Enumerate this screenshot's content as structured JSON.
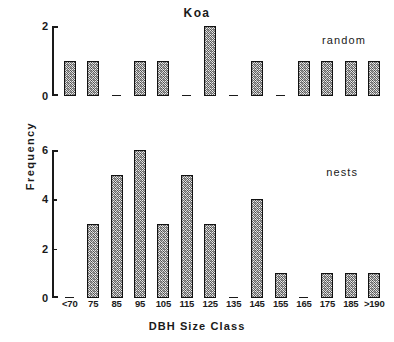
{
  "figure": {
    "title": "Koa",
    "xaxis_title": "DBH Size Class",
    "yaxis_title": "Frequency"
  },
  "panels": {
    "random": {
      "note": "random",
      "yticks": [
        "2",
        "0"
      ]
    },
    "nests": {
      "note": "nests",
      "yticks": [
        "6",
        "4",
        "2",
        "0"
      ]
    }
  },
  "chart_data": [
    {
      "type": "bar",
      "title": "Koa",
      "series_label": "random",
      "panel": "top",
      "categories": [
        "<70",
        "75",
        "85",
        "95",
        "105",
        "115",
        "125",
        "135",
        "145",
        "155",
        "165",
        "175",
        "185",
        ">190"
      ],
      "values": [
        1,
        1,
        0,
        1,
        1,
        0,
        2,
        0,
        1,
        0,
        1,
        1,
        1,
        1
      ],
      "xlabel": "DBH Size Class",
      "ylabel": "Frequency",
      "ylim": [
        0,
        2
      ],
      "ytick_values": [
        0,
        2
      ],
      "grid": false,
      "legend": "none"
    },
    {
      "type": "bar",
      "title": "Koa",
      "series_label": "nests",
      "panel": "bottom",
      "categories": [
        "<70",
        "75",
        "85",
        "95",
        "105",
        "115",
        "125",
        "135",
        "145",
        "155",
        "165",
        "175",
        "185",
        ">190"
      ],
      "values": [
        0,
        3,
        5,
        6,
        3,
        5,
        3,
        0,
        4,
        1,
        0,
        1,
        1,
        1
      ],
      "xlabel": "DBH Size Class",
      "ylabel": "Frequency",
      "ylim": [
        0,
        6
      ],
      "ytick_values": [
        0,
        2,
        4,
        6
      ],
      "grid": false,
      "legend": "none"
    }
  ],
  "style": {
    "bar_fill": "#d2d2d2",
    "bar_border": "#111111",
    "axis_color": "#1a1a1a",
    "background": "#ffffff"
  }
}
